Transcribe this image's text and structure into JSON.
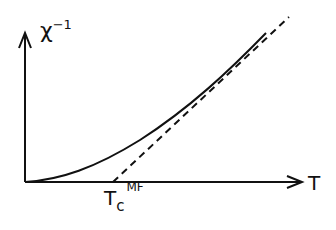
{
  "diagram": {
    "y_axis_label": "χ",
    "y_axis_label_sup": "−1",
    "x_axis_label": "T",
    "tc_label": "T",
    "tc_sub": "c",
    "tc_sup": "MF",
    "curves": [
      {
        "name": "actual inverse susceptibility",
        "style": "solid"
      },
      {
        "name": "mean-field (Curie-Weiss) asymptote",
        "style": "dashed"
      }
    ]
  }
}
